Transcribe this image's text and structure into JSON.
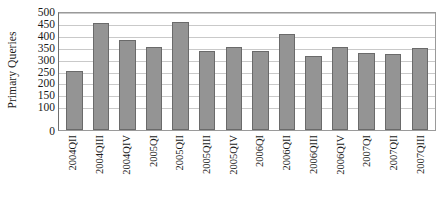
{
  "chart_data": {
    "type": "bar",
    "title": "",
    "xlabel": "",
    "ylabel": "Primary Queries",
    "ylim": [
      0,
      500
    ],
    "grid": true,
    "legend": false,
    "legend_position": "none",
    "y_ticks": [
      0,
      100,
      150,
      200,
      250,
      300,
      350,
      400,
      450,
      500
    ],
    "y_tick_labels": [
      "0",
      "100",
      "150",
      "200",
      "250",
      "300",
      "350",
      "400",
      "450",
      "500"
    ],
    "categories": [
      "2004QII",
      "2004QIII",
      "2004QIV",
      "2005QI",
      "2005QII",
      "2005QIII",
      "2005QIV",
      "2006QI",
      "2006QII",
      "2006QIII",
      "2006QIV",
      "2007QI",
      "2007QII",
      "2007QIII"
    ],
    "values": [
      250,
      450,
      380,
      350,
      455,
      330,
      350,
      330,
      405,
      310,
      350,
      325,
      320,
      345
    ],
    "bar_color": "#949494",
    "bar_border_color": "#6a6a6a",
    "gridline_color": "#c9c9c9",
    "axis_color": "#6f6f6f",
    "plot_background": "#ffffff"
  }
}
